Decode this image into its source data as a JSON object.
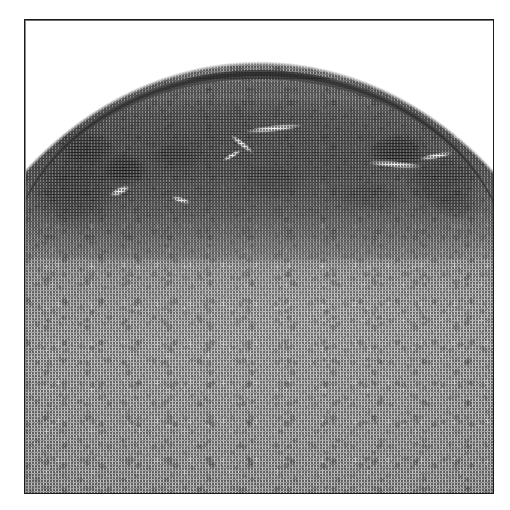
{
  "figure": {
    "kind": "histopathology-micrograph",
    "staining": "grayscale halftone print reproduction",
    "title": "",
    "caption": "",
    "label": "",
    "magnification": "",
    "scale_bar": ""
  },
  "frame": {
    "border_color": "#1b1b1b",
    "border_width_px": 1,
    "x": 24,
    "y": 19,
    "width": 470,
    "height": 475,
    "background_color": "#ffffff"
  },
  "canvas": {
    "width": 510,
    "height": 510,
    "background_color": "#ffffff"
  },
  "regions": {
    "empty_slide_space": {
      "name": "blank slide background above tissue",
      "color": "#ffffff",
      "position": "top band inside frame"
    },
    "tissue_dome": {
      "name": "arched tissue surface",
      "apex_y": 62,
      "edge_left_y": 85,
      "edge_right_y": 90,
      "base_tone": "#adadad"
    },
    "surface_epithelium": {
      "name": "dark surface epithelial band",
      "tone": "#3c3c3c",
      "thickness_px": 9
    },
    "inflammatory_zone": {
      "name": "hypercellular dark subepithelial zone",
      "tone": "#2a2a2a",
      "top_y": 95,
      "bottom_y": 230
    },
    "deep_stroma": {
      "name": "uniform deep stromal tissue",
      "tone": "#b0b0b0",
      "top_y": 230,
      "bottom_y": 493
    }
  },
  "features": {
    "dark_aggregates": [
      {
        "name": "left-lateral dense band",
        "x": 30,
        "y": 150,
        "w": 90,
        "h": 80,
        "opacity": 0.62
      },
      {
        "name": "left lymphoid nodule",
        "x": 100,
        "y": 152,
        "w": 50,
        "h": 34,
        "opacity": 0.95
      },
      {
        "name": "left upper cluster",
        "x": 55,
        "y": 128,
        "w": 62,
        "h": 40,
        "opacity": 0.7
      },
      {
        "name": "mid-left cluster",
        "x": 150,
        "y": 138,
        "w": 56,
        "h": 34,
        "opacity": 0.52
      },
      {
        "name": "central cluster",
        "x": 238,
        "y": 160,
        "w": 70,
        "h": 38,
        "opacity": 0.48
      },
      {
        "name": "right lymphoid nodule",
        "x": 368,
        "y": 132,
        "w": 62,
        "h": 36,
        "opacity": 0.92
      },
      {
        "name": "right-lateral band",
        "x": 404,
        "y": 150,
        "w": 80,
        "h": 62,
        "opacity": 0.6
      },
      {
        "name": "right lower cluster",
        "x": 330,
        "y": 178,
        "w": 78,
        "h": 34,
        "opacity": 0.45
      },
      {
        "name": "far-right deep cluster",
        "x": 430,
        "y": 190,
        "w": 56,
        "h": 30,
        "opacity": 0.42
      }
    ],
    "vessel_clefts": [
      {
        "name": "central branching cleft",
        "x": 246,
        "y": 124,
        "w": 58,
        "h": 7,
        "rot": -6
      },
      {
        "name": "central cleft branch",
        "x": 228,
        "y": 140,
        "w": 30,
        "h": 6,
        "rot": 38
      },
      {
        "name": "central cleft tail",
        "x": 222,
        "y": 152,
        "w": 22,
        "h": 5,
        "rot": -30
      },
      {
        "name": "right elongated cleft",
        "x": 368,
        "y": 160,
        "w": 56,
        "h": 7,
        "rot": 4
      },
      {
        "name": "right cleft secondary",
        "x": 420,
        "y": 152,
        "w": 34,
        "h": 6,
        "rot": -10
      },
      {
        "name": "left small cleft",
        "x": 110,
        "y": 186,
        "w": 22,
        "h": 8,
        "rot": -24
      },
      {
        "name": "upper-right cleft",
        "x": 452,
        "y": 130,
        "w": 30,
        "h": 6,
        "rot": -14
      },
      {
        "name": "mid-left cleft",
        "x": 172,
        "y": 196,
        "w": 20,
        "h": 6,
        "rot": 16
      }
    ]
  },
  "palette": {
    "frame": "#1b1b1b",
    "background": "#ffffff",
    "tissue_light": "#c6c6c6",
    "tissue_mid": "#a8a8a8",
    "tissue_dark": "#4a4a4a",
    "nuclei_black": "#111111",
    "lumen_white": "#fdfdfd"
  }
}
